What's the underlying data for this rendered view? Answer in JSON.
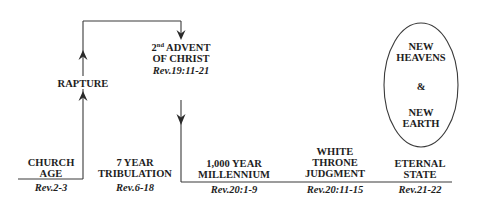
{
  "diagram": {
    "stroke_color": "#3a3a3a",
    "text_color": "#1e1e1e",
    "events": {
      "rapture": {
        "label": "RAPTURE"
      },
      "second_advent": {
        "ordinal": "2",
        "ordinal_suffix": "nd",
        "line1_rest": " ADVENT",
        "line2": "OF CHRIST",
        "ref": "Rev.19:11-21"
      }
    },
    "periods": [
      {
        "lines": [
          "CHURCH",
          "AGE"
        ],
        "ref": "Rev.2-3"
      },
      {
        "lines": [
          "7 YEAR",
          "TRIBULATION"
        ],
        "ref": "Rev.6-18"
      },
      {
        "lines": [
          "1,000 YEAR",
          "MILLENNIUM"
        ],
        "ref": "Rev.20:1-9"
      },
      {
        "lines": [
          "WHITE",
          "THRONE",
          "JUDGMENT"
        ],
        "ref": "Rev.20:11-15"
      },
      {
        "lines": [
          "ETERNAL",
          "STATE"
        ],
        "ref": "Rev.21-22"
      }
    ],
    "ellipse": {
      "lines": [
        "NEW",
        "HEAVENS",
        "&",
        "NEW",
        "EARTH"
      ]
    }
  }
}
